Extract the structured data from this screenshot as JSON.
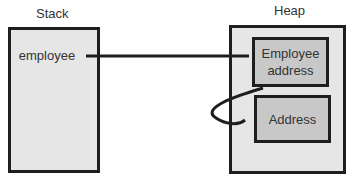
{
  "diagram": {
    "stack": {
      "title": "Stack",
      "variable": "employee"
    },
    "heap": {
      "title": "Heap",
      "objects": [
        {
          "label": "Employee address"
        },
        {
          "label": "Address"
        }
      ]
    },
    "edges": [
      {
        "from": "employee",
        "to": "Employee address",
        "style": "straight"
      },
      {
        "from": "Employee address",
        "to": "Address",
        "style": "curved"
      }
    ],
    "colors": {
      "border": "#1e1e1e",
      "outer_fill": "#e6e6e6",
      "inner_fill": "#c8c8c8"
    }
  }
}
